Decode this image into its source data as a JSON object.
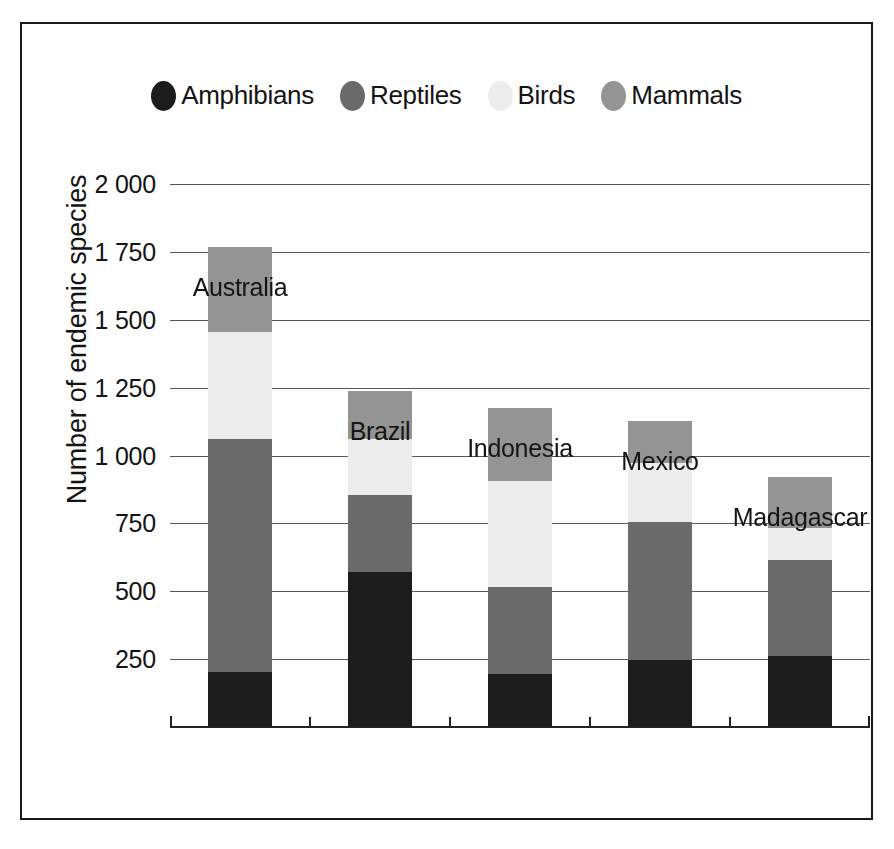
{
  "chart_data": {
    "type": "bar",
    "subtype": "stacked-vertical-bar",
    "title": "",
    "xlabel": "",
    "ylabel": "Number of endemic species",
    "ylim": [
      0,
      2000
    ],
    "ytick_step": 250,
    "ytick_labels": [
      "0",
      "250",
      "500",
      "750",
      "1 000",
      "1 250",
      "1 500",
      "1 750",
      "2 000"
    ],
    "ytick_values": [
      0,
      250,
      500,
      750,
      1000,
      1250,
      1500,
      1750,
      2000
    ],
    "grid": true,
    "legend_position": "top",
    "categories": [
      "Australia",
      "Brazil",
      "Indonesia",
      "Mexico",
      "Madagascar"
    ],
    "series": [
      {
        "name": "Amphibians",
        "color": "#1c1c1c",
        "values": [
          205,
          575,
          200,
          250,
          265
        ]
      },
      {
        "name": "Reptiles",
        "color": "#6a6a6a",
        "values": [
          860,
          285,
          320,
          510,
          355
        ]
      },
      {
        "name": "Birds",
        "color": "#ededed",
        "values": [
          395,
          205,
          390,
          215,
          115
        ]
      },
      {
        "name": "Mammals",
        "color": "#949494",
        "values": [
          310,
          175,
          270,
          155,
          190
        ]
      }
    ],
    "totals": [
      1770,
      1240,
      1180,
      1130,
      925
    ]
  },
  "legend": {
    "items": [
      {
        "label": "Amphibians",
        "color": "#1c1c1c"
      },
      {
        "label": "Reptiles",
        "color": "#6a6a6a"
      },
      {
        "label": "Birds",
        "color": "#ededed"
      },
      {
        "label": "Mammals",
        "color": "#949494"
      }
    ]
  },
  "axis": {
    "y_title": "Number of endemic species"
  },
  "colors": {
    "frame": "#1a1a1a",
    "gridline": "#55595c",
    "axis": "#232323",
    "background": "#ffffff",
    "text": "#141414"
  }
}
